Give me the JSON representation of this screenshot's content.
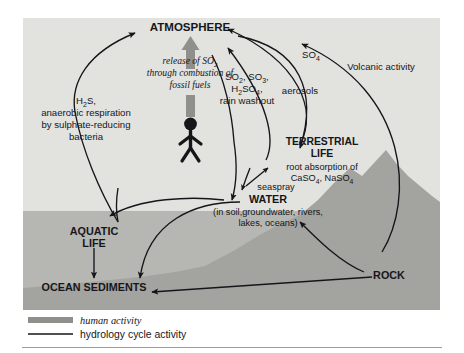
{
  "figure": {
    "nodes": {
      "atmosphere": "ATMOSPHERE",
      "terrestrial_life_1": "TERRESTRIAL",
      "terrestrial_life_2": "LIFE",
      "water": "WATER",
      "water_sub_1": "(in soil,groundwater, rivers,",
      "water_sub_2": "lakes, oceans)",
      "aquatic_life_1": "AQUATIC",
      "aquatic_life_2": "LIFE",
      "ocean_sediments": "OCEAN SEDIMENTS",
      "rock": "ROCK"
    },
    "annotations": {
      "human_release_1": "release of SO",
      "human_release_1_sub": "2",
      "human_release_2": "through combustion of",
      "human_release_3": "fossil fuels",
      "h2s_1": "H",
      "h2s_1_sub": "2",
      "h2s_1_end": "S,",
      "h2s_2": "anaerobic respiration",
      "h2s_3": "by sulphate-reducing",
      "h2s_4": "bacteria",
      "so2_line1_a": "SO",
      "so2_line1_a_sub": "2",
      "so2_line1_b": ", SO",
      "so2_line1_b_sub": "3",
      "so2_line1_c": ",",
      "so2_line2_a": "H",
      "so2_line2_a_sub": "2",
      "so2_line2_b": "SO",
      "so2_line2_b_sub": "4",
      "so2_line2_c": ",",
      "so2_line3": "rain washout",
      "aerosols": "aerosols",
      "so4_a": "SO",
      "so4_sub": "4",
      "volcanic": "Volcanic activity",
      "seaspray": "seaspray",
      "root_absorption_1": "root absorption of",
      "root_absorption_2_a": "CaSO",
      "root_absorption_2_a_sub": "4",
      "root_absorption_2_b": ", NaSO",
      "root_absorption_2_b_sub": "4"
    },
    "legend": {
      "items": [
        {
          "key": "human-activity",
          "label": "human activity",
          "style": "thick-gray-bar",
          "color": "#8f8f8c",
          "italic": true
        },
        {
          "key": "hydrology-cycle-activity",
          "label": "hydrology cycle activity",
          "style": "thin-black-line",
          "color": "#16161a",
          "italic": false
        }
      ]
    },
    "colors": {
      "sky": "#e2e2df",
      "water": "#b6b6b2",
      "land": "#a3a3a0",
      "arrow": "#16161a",
      "human_arrow": "#8f8f8c",
      "page": "#ffffff",
      "rule": "#9b9b98"
    }
  }
}
